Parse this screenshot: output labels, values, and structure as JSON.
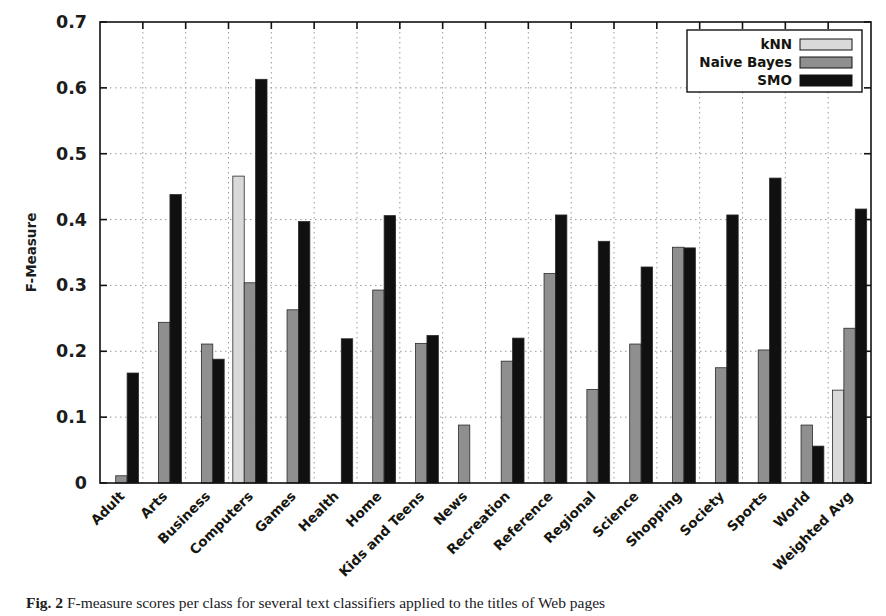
{
  "chart_data": {
    "type": "bar",
    "title": "",
    "xlabel": "",
    "ylabel": "F-Measure",
    "ylim": [
      0,
      0.7
    ],
    "ytick_values": [
      0,
      0.1,
      0.2,
      0.3,
      0.4,
      0.5,
      0.6,
      0.7
    ],
    "ytick_labels": [
      "0",
      "0.1",
      "0.2",
      "0.3",
      "0.4",
      "0.5",
      "0.6",
      "0.7"
    ],
    "grid": true,
    "grid_style": "dotted",
    "legend_position": "top-right",
    "categories": [
      "Adult",
      "Arts",
      "Business",
      "Computers",
      "Games",
      "Health",
      "Home",
      "Kids and Teens",
      "News",
      "Recreation",
      "Reference",
      "Regional",
      "Science",
      "Shopping",
      "Society",
      "Sports",
      "World",
      "Weighted Avg"
    ],
    "series": [
      {
        "name": "kNN",
        "color": "#d9d9d9",
        "values": [
          0,
          0,
          0,
          0.466,
          0,
          0,
          0,
          0,
          0,
          0,
          0,
          0,
          0,
          0,
          0,
          0,
          0,
          0.141
        ]
      },
      {
        "name": "Naive Bayes",
        "color": "#8f8f8f",
        "values": [
          0.011,
          0.244,
          0.211,
          0.304,
          0.263,
          0,
          0.293,
          0.212,
          0.088,
          0.185,
          0.318,
          0.142,
          0.211,
          0.358,
          0.175,
          0.202,
          0.088,
          0.235
        ]
      },
      {
        "name": "SMO",
        "color": "#101010",
        "values": [
          0.167,
          0.438,
          0.188,
          0.613,
          0.397,
          0.219,
          0.406,
          0.224,
          0,
          0.22,
          0.407,
          0.367,
          0.328,
          0.357,
          0.407,
          0.463,
          0.056,
          0.416
        ]
      }
    ]
  },
  "legend": {
    "entries": [
      {
        "label": "kNN",
        "color": "#d9d9d9"
      },
      {
        "label": "Naive Bayes",
        "color": "#8f8f8f"
      },
      {
        "label": "SMO",
        "color": "#101010"
      }
    ]
  },
  "caption": {
    "figure_number": "Fig. 2",
    "text": "F-measure scores per class for several text classifiers applied to the titles of Web pages"
  }
}
